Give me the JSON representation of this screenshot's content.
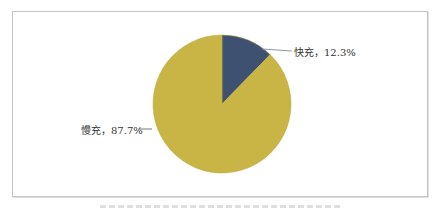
{
  "chart_data": {
    "type": "pie",
    "title": "",
    "slices": [
      {
        "label": "快充",
        "value": 12.3,
        "color": "#3e5170",
        "display": "快充，12.3%"
      },
      {
        "label": "慢充",
        "value": 87.7,
        "color": "#c9b545",
        "display": "慢充，87.7%"
      }
    ],
    "start_angle_deg": 0,
    "direction": "clockwise",
    "legend": "none",
    "labels_position": "outside with leader lines"
  },
  "labels": {
    "fast": "快充，12.3%",
    "slow": "慢充，87.7%"
  }
}
